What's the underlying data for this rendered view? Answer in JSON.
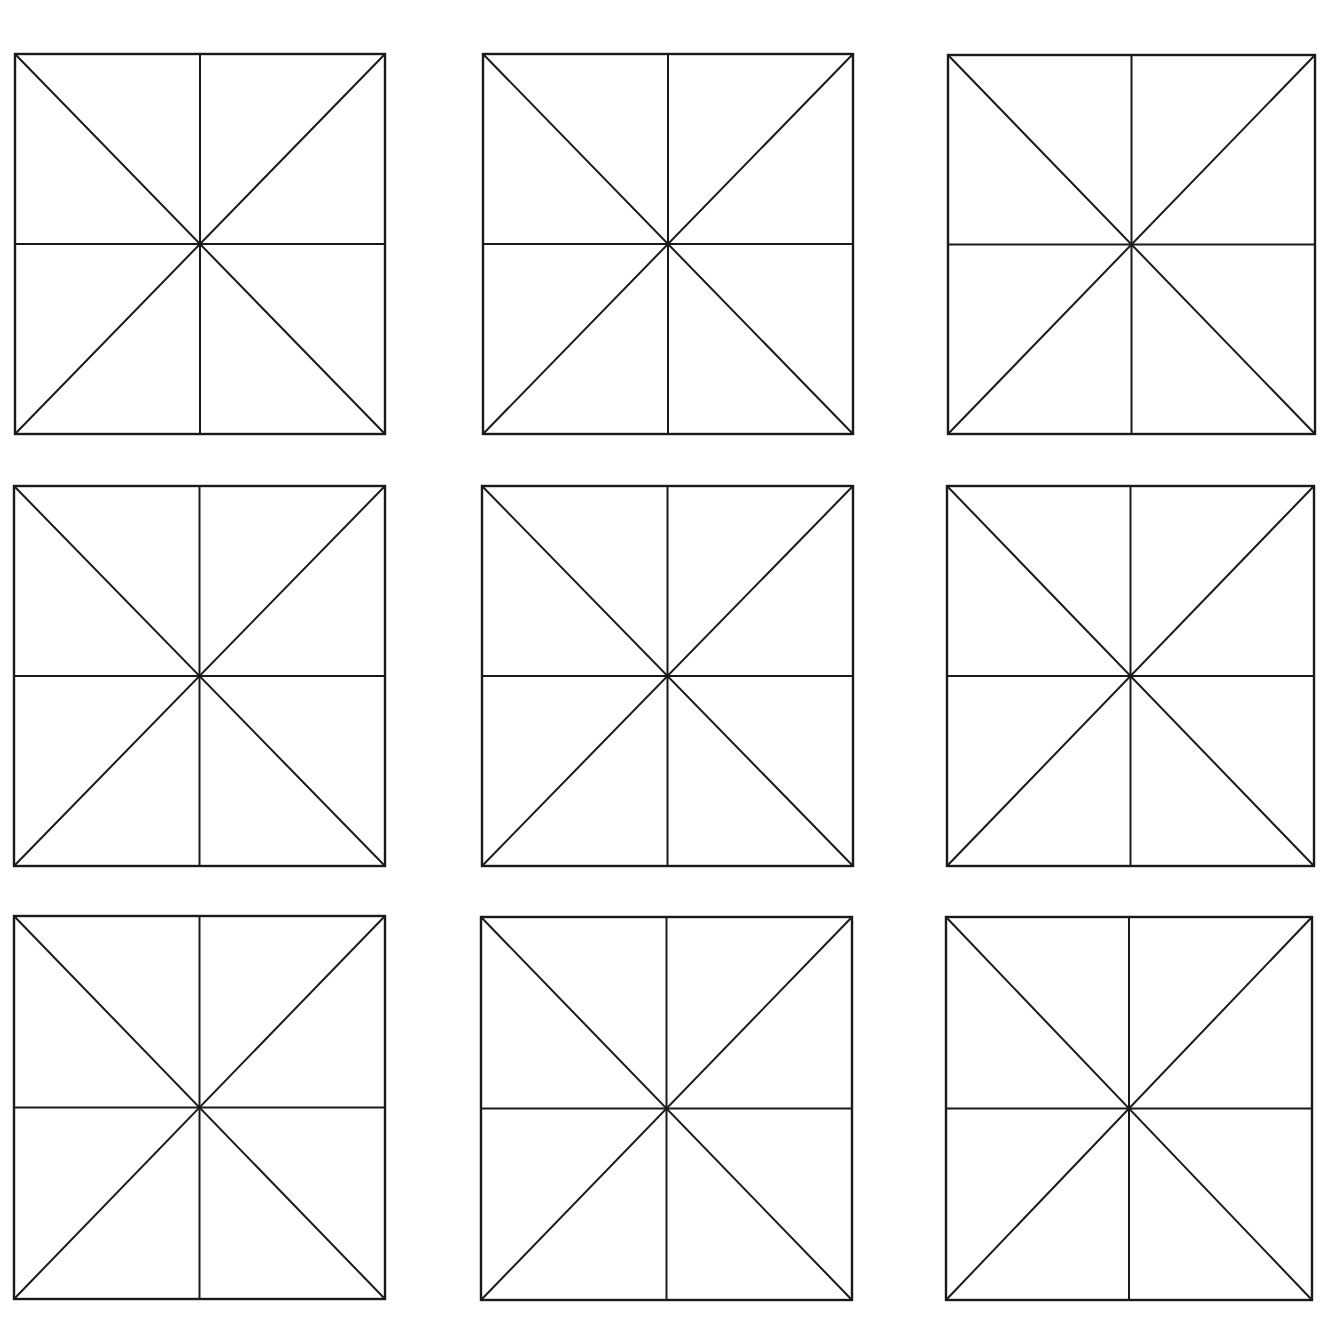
{
  "diagram": {
    "type": "mi-zi-ge-practice-grid",
    "rows": 3,
    "columns": 3,
    "background_color": "#ffffff",
    "line_color": "#1a1a1a",
    "cell_guides": [
      "border",
      "vertical-midline",
      "horizontal-midline",
      "diagonal-tl-br",
      "diagonal-tr-bl"
    ],
    "cells": [
      {
        "row": 1,
        "col": 1,
        "x1": 15,
        "y1": 54,
        "x2": 385,
        "y2": 434
      },
      {
        "row": 1,
        "col": 2,
        "x1": 483,
        "y1": 54,
        "x2": 853,
        "y2": 434
      },
      {
        "row": 1,
        "col": 3,
        "x1": 948,
        "y1": 55,
        "x2": 1315,
        "y2": 434
      },
      {
        "row": 2,
        "col": 1,
        "x1": 14,
        "y1": 486,
        "x2": 385,
        "y2": 866
      },
      {
        "row": 2,
        "col": 2,
        "x1": 482,
        "y1": 486,
        "x2": 853,
        "y2": 866
      },
      {
        "row": 2,
        "col": 3,
        "x1": 947,
        "y1": 486,
        "x2": 1314,
        "y2": 866
      },
      {
        "row": 3,
        "col": 1,
        "x1": 14,
        "y1": 916,
        "x2": 385,
        "y2": 1299
      },
      {
        "row": 3,
        "col": 2,
        "x1": 481,
        "y1": 917,
        "x2": 852,
        "y2": 1300
      },
      {
        "row": 3,
        "col": 3,
        "x1": 946,
        "y1": 917,
        "x2": 1312,
        "y2": 1300
      }
    ]
  }
}
